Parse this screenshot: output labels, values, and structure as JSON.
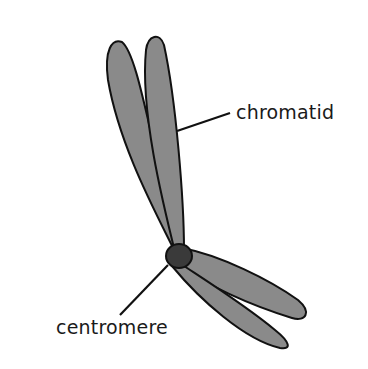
{
  "diagram": {
    "labels": {
      "chromatid": "chromatid",
      "centromere": "centromere"
    },
    "colors": {
      "chromatid_fill": "#8a8a8a",
      "centromere_fill": "#3a3a3a",
      "outline": "#111111"
    }
  }
}
